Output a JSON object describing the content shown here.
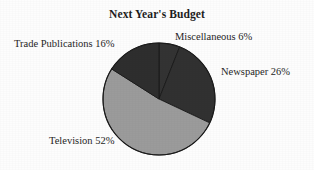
{
  "chart_data": {
    "type": "pie",
    "title": "Next Year's Budget",
    "categories": [
      "Miscellaneous",
      "Newspaper",
      "Television",
      "Trade Publications"
    ],
    "values": [
      6,
      26,
      52,
      16
    ],
    "unit": "%",
    "start_angle_deg": 0,
    "direction": "clockwise",
    "legend": "none",
    "grid": false,
    "labels": [
      {
        "name": "Miscellaneous",
        "value": 6,
        "text": "Miscellaneous 6%",
        "color": "#333333"
      },
      {
        "name": "Newspaper",
        "value": 26,
        "text": "Newspaper 26%",
        "color": "#313131"
      },
      {
        "name": "Television",
        "value": 52,
        "text": "Television 52%",
        "color": "#9b9b9b"
      },
      {
        "name": "Trade Publications",
        "value": 16,
        "text": "Trade Publications 16%",
        "color": "#2e2e2e"
      }
    ],
    "colors": {
      "background": "#fdfdfd",
      "slice_dark": "#333333",
      "slice_light": "#9b9b9b",
      "outline": "#1a1a1a",
      "text": "#262626"
    },
    "geometry": {
      "center_x": 159,
      "center_y": 99,
      "radius": 56
    }
  }
}
